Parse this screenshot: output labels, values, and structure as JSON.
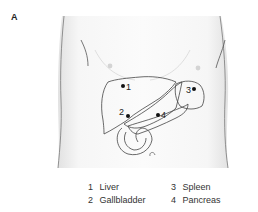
{
  "figure": {
    "panel_label": "A",
    "colors": {
      "skin_fill": "#f4f4f4",
      "outline": "#555555",
      "organ_outline": "#444444",
      "marker": "#111111",
      "text": "#333333"
    }
  },
  "markers": [
    {
      "number": "1",
      "organ": "Liver"
    },
    {
      "number": "2",
      "organ": "Gallbladder"
    },
    {
      "number": "3",
      "organ": "Spleen"
    },
    {
      "number": "4",
      "organ": "Pancreas"
    }
  ],
  "legend": {
    "items": [
      {
        "number": "1",
        "label": "Liver"
      },
      {
        "number": "2",
        "label": "Gallbladder"
      },
      {
        "number": "3",
        "label": "Spleen"
      },
      {
        "number": "4",
        "label": "Pancreas"
      }
    ]
  }
}
